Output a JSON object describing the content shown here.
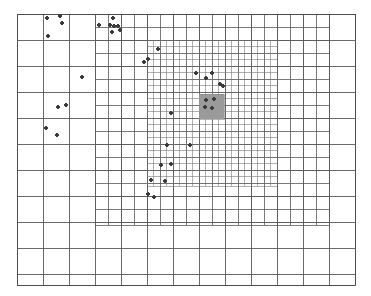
{
  "figure": {
    "type": "amr-grid-diagram",
    "background_color": "#ffffff",
    "canvas": {
      "width": 371,
      "height": 296
    }
  },
  "styles": {
    "grid_line_color": "#5a5a5a",
    "grid_line_color_fine": "#6e6e6e",
    "border_color": "#4a4a4a",
    "block_fill": "#9a9a9a",
    "block_stroke": "#8a8a8a",
    "particle_color": "#3a3a3a",
    "particle_radius": 1.9,
    "border_width": 0.9,
    "level1_width": 0.9,
    "level2_width": 0.8,
    "level3_width": 0.55
  },
  "domain": {
    "x0": 17,
    "y0": 14,
    "x1": 355,
    "y1": 285,
    "label": "simulation-domain"
  },
  "levels": [
    {
      "name": "level-1-coarse",
      "level": 1,
      "x0": 17,
      "y0": 14,
      "x1": 355,
      "y1": 285,
      "cell": 26.0,
      "nx": 13,
      "ny": 10.42
    },
    {
      "name": "level-2-medium",
      "level": 2,
      "x0": 95,
      "y0": 14,
      "x1": 329,
      "y1": 225,
      "cell": 13.0,
      "nx": 18,
      "ny": 16.2
    },
    {
      "name": "level-3-fine",
      "level": 3,
      "x0": 147,
      "y0": 40,
      "x1": 277,
      "y1": 186,
      "cell": 6.5,
      "nx": 20,
      "ny": 22.5
    }
  ],
  "refined_block": {
    "name": "highlighted-refined-block",
    "x": 199,
    "y": 94,
    "width": 25,
    "height": 25,
    "fill": "#9a9a9a"
  },
  "particles": {
    "count": 31,
    "points": [
      [
        47,
        18
      ],
      [
        60,
        16
      ],
      [
        62,
        23
      ],
      [
        48,
        36
      ],
      [
        99,
        25
      ],
      [
        113,
        18
      ],
      [
        110,
        25
      ],
      [
        114,
        26
      ],
      [
        118,
        26
      ],
      [
        112,
        32
      ],
      [
        120,
        30
      ],
      [
        158,
        49
      ],
      [
        144,
        62
      ],
      [
        148,
        59
      ],
      [
        196,
        73
      ],
      [
        206,
        78
      ],
      [
        212,
        73
      ],
      [
        220,
        84
      ],
      [
        223,
        86
      ],
      [
        206,
        100
      ],
      [
        214,
        99
      ],
      [
        205,
        107
      ],
      [
        212,
        108
      ],
      [
        82,
        77
      ],
      [
        58,
        107
      ],
      [
        66,
        105
      ],
      [
        46,
        128
      ],
      [
        57,
        135
      ],
      [
        171,
        113
      ],
      [
        167,
        145
      ],
      [
        190,
        145
      ],
      [
        161,
        165
      ],
      [
        171,
        164
      ],
      [
        151,
        180
      ],
      [
        165,
        181
      ],
      [
        148,
        194
      ],
      [
        154,
        197
      ]
    ]
  }
}
